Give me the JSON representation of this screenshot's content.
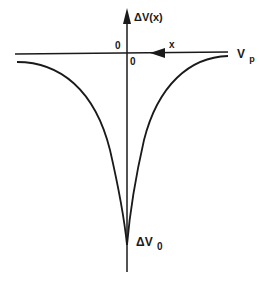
{
  "diagram": {
    "type": "potential-profile",
    "axes": {
      "vertical_label": "ΔV(x)",
      "horizontal_label": "x",
      "horizontal_direction": "leftward arrow",
      "origin_label_left": "0",
      "origin_label_below": "0"
    },
    "reference_line": {
      "label_main": "V",
      "label_sub": "p"
    },
    "minimum": {
      "label_main": "ΔV",
      "label_sub": "0"
    },
    "colors": {
      "line": "#1a1a1a",
      "background": "#ffffff"
    }
  }
}
